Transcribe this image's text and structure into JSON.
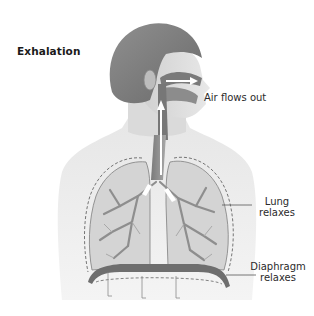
{
  "diagram": {
    "title": "Exhalation",
    "labels": {
      "air": "Air flows out",
      "lung_line1": "Lung",
      "lung_line2": "relaxes",
      "diaphragm_line1": "Diaphragm",
      "diaphragm_line2": "relaxes"
    },
    "colors": {
      "background": "#ffffff",
      "skin_head": "#8a8a8a",
      "torso": "#ececec",
      "lung_fill": "#cfcfcf",
      "bronchi": "#9a9a9a",
      "diaphragm": "#6e6e6e",
      "arrow": "#ffffff",
      "leader_line": "#555555",
      "text": "#2b2b2b"
    }
  }
}
